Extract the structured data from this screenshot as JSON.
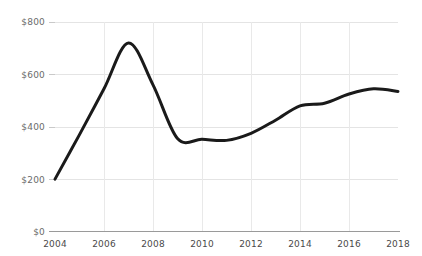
{
  "chart_data": {
    "type": "line",
    "title": "",
    "subtitle": "",
    "xlabel": "",
    "ylabel": "",
    "xlim": [
      2004,
      2018
    ],
    "ylim": [
      0,
      800
    ],
    "grid": true,
    "legend": false,
    "legend_position": "none",
    "line_color": "#1a1a1a",
    "grid_color": "#e4e4e4",
    "axis_color": "#9a9a9a",
    "ytick_label_color": "#6b6b6b",
    "xtick_label_color": "#4a4a4a",
    "ytick_labels": [
      "$800",
      "$600",
      "$400",
      "$200",
      "$0"
    ],
    "ytick_values": [
      800,
      600,
      400,
      200,
      0
    ],
    "xtick_labels": [
      "2004",
      "2006",
      "2008",
      "2010",
      "2012",
      "2014",
      "2016",
      "2018"
    ],
    "xtick_values": [
      2004,
      2006,
      2008,
      2010,
      2012,
      2014,
      2016,
      2018
    ],
    "series": [
      {
        "name": "value",
        "x": [
          2004,
          2005,
          2006,
          2007,
          2008,
          2009,
          2010,
          2011,
          2012,
          2013,
          2014,
          2015,
          2016,
          2017,
          2018
        ],
        "values": [
          200,
          370,
          545,
          720,
          560,
          355,
          352,
          348,
          375,
          425,
          480,
          490,
          525,
          545,
          535
        ]
      }
    ]
  }
}
